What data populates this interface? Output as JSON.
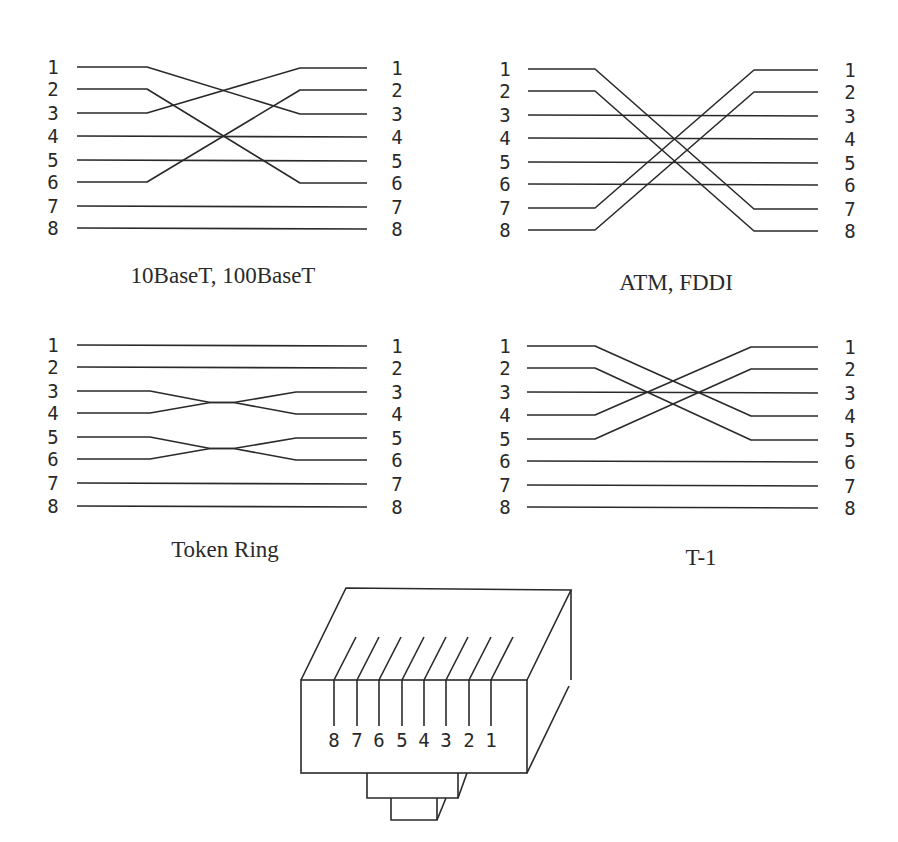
{
  "diagrams": [
    {
      "id": "ethernet",
      "caption": "10BaseT, 100BaseT",
      "caption_pos": [
        223,
        283
      ],
      "left_label_x": 53,
      "right_label_x": 397,
      "line_x": [
        77,
        147,
        300,
        367
      ],
      "left_y": [
        67,
        89,
        113,
        136,
        160,
        182,
        206,
        228
      ],
      "right_y": [
        68,
        90,
        114,
        137,
        161,
        183,
        207,
        229
      ],
      "pins": [
        "1",
        "2",
        "3",
        "4",
        "5",
        "6",
        "7",
        "8"
      ],
      "mapping": {
        "1": "3",
        "2": "6",
        "3": "1",
        "4": "4",
        "5": "5",
        "6": "2",
        "7": "7",
        "8": "8"
      }
    },
    {
      "id": "atm-fddi",
      "caption": "ATM, FDDI",
      "caption_pos": [
        676,
        290
      ],
      "left_label_x": 505,
      "right_label_x": 850,
      "line_x": [
        528,
        595,
        754,
        818
      ],
      "left_y": [
        69,
        91,
        115,
        138,
        162,
        184,
        208,
        230
      ],
      "right_y": [
        70,
        92,
        116,
        139,
        163,
        185,
        209,
        231
      ],
      "pins": [
        "1",
        "2",
        "3",
        "4",
        "5",
        "6",
        "7",
        "8"
      ],
      "mapping": {
        "1": "7",
        "2": "8",
        "3": "3",
        "4": "4",
        "5": "5",
        "6": "6",
        "7": "1",
        "8": "2"
      }
    },
    {
      "id": "token-ring",
      "caption": "Token Ring",
      "caption_pos": [
        225,
        557
      ],
      "left_label_x": 53,
      "right_label_x": 397,
      "line_x": [
        77,
        150,
        296,
        367
      ],
      "left_y": [
        345,
        367,
        391,
        413,
        437,
        459,
        483,
        506
      ],
      "right_y": [
        346,
        368,
        392,
        414,
        438,
        460,
        484,
        507
      ],
      "pins": [
        "1",
        "2",
        "3",
        "4",
        "5",
        "6",
        "7",
        "8"
      ],
      "mapping": {
        "1": "1",
        "2": "2",
        "3": "4",
        "4": "3",
        "5": "6",
        "6": "5",
        "7": "7",
        "8": "8"
      },
      "style": "twist"
    },
    {
      "id": "t1",
      "caption": "T-1",
      "caption_pos": [
        701,
        565
      ],
      "left_label_x": 505,
      "right_label_x": 850,
      "line_x": [
        527,
        595,
        751,
        818
      ],
      "left_y": [
        346,
        368,
        392,
        415,
        439,
        461,
        485,
        507
      ],
      "right_y": [
        347,
        369,
        393,
        416,
        440,
        462,
        486,
        508
      ],
      "pins": [
        "1",
        "2",
        "3",
        "4",
        "5",
        "6",
        "7",
        "8"
      ],
      "mapping": {
        "1": "4",
        "2": "5",
        "3": "3",
        "4": "1",
        "5": "2",
        "6": "6",
        "7": "7",
        "8": "8"
      }
    }
  ],
  "connector": {
    "name": "RJ-45 plug",
    "pin_labels": [
      "8",
      "7",
      "6",
      "5",
      "4",
      "3",
      "2",
      "1"
    ],
    "pin_x": [
      334,
      357,
      379,
      402,
      424,
      446,
      469,
      491
    ],
    "pin_top_y": 680,
    "pin_bottom_y": 726,
    "slant_top_y": 637,
    "slant_dx": 22,
    "label_y": 747,
    "front": {
      "x1": 301,
      "y1": 680,
      "x2": 527,
      "y2": 773
    },
    "back_top": {
      "x1": 346,
      "y1": 588,
      "x2": 571,
      "y2": 590
    },
    "tab1": {
      "x1": 367,
      "y1": 773,
      "x2": 458,
      "y2": 798
    },
    "tab2": {
      "x1": 391,
      "y1": 798,
      "x2": 437,
      "y2": 820
    }
  }
}
